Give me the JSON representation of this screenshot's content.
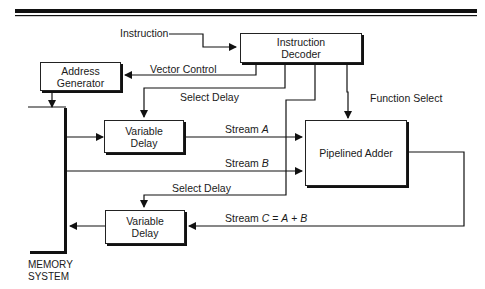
{
  "diagram": {
    "blocks": {
      "instruction_decoder": {
        "line1": "Instruction",
        "line2": "Decoder"
      },
      "address_generator": {
        "line1": "Address",
        "line2": "Generator"
      },
      "variable_delay_top": {
        "line1": "Variable",
        "line2": "Delay"
      },
      "variable_delay_bottom": {
        "line1": "Variable",
        "line2": "Delay"
      },
      "pipelined_adder": {
        "label": "Pipelined Adder"
      },
      "memory_system": {
        "line1": "MEMORY",
        "line2": "SYSTEM"
      }
    },
    "signals": {
      "instruction": "Instruction",
      "vector_control": "Vector Control",
      "select_delay_top": "Select Delay",
      "function_select": "Function Select",
      "stream_a_prefix": "Stream",
      "stream_a_var": "A",
      "stream_b_prefix": "Stream",
      "stream_b_var": "B",
      "select_delay_bottom": "Select Delay",
      "stream_c_prefix": "Stream",
      "stream_c_var": "C",
      "stream_c_eq": "=",
      "stream_c_a": "A",
      "stream_c_plus": "+",
      "stream_c_b": "B"
    }
  }
}
